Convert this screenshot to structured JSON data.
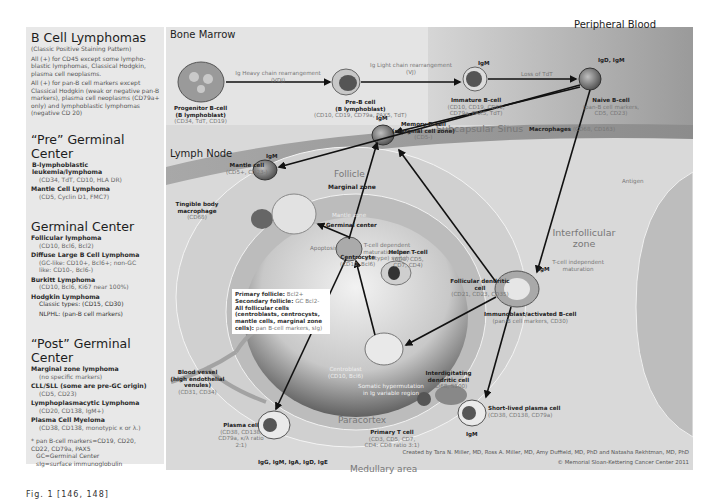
{
  "left_panel": {
    "title": "B Cell Lymphomas",
    "subtitle": "(Classic Positive Staining Pattern)",
    "notes": [
      "All (+) for CD45 except some lympho-blastic lymphomas, Classical Hodgkin, plasma cell neoplasms.",
      "All (+) for pan-B cell markers except Classical Hodgkin (weak or negative pan-B markers), plasma cell neoplasms (CD79a+ only) and lymphoblastic lymphomas (negative CD 20)"
    ],
    "sections": [
      {
        "heading": "“Pre” Germinal Center",
        "items": [
          {
            "name": "B-lymphoblastic leukemia/lymphoma",
            "markers": "(CD34, TdT, CD10, HLA DR)"
          },
          {
            "name": "Mantle Cell Lymphoma",
            "markers": "(CD5, Cyclin D1, FMC7)"
          }
        ]
      },
      {
        "heading": "Germinal Center",
        "items": [
          {
            "name": "Follicular lymphoma",
            "markers": "(CD10, Bcl6, Bcl2)"
          },
          {
            "name": "Diffuse Large B Cell Lymphoma",
            "markers": "(GC-like: CD10+, Bcl6+; non-GC like: CD10-, Bcl6-)"
          },
          {
            "name": "Burkitt Lymphoma",
            "markers": "(CD10, Bcl6, Ki67 near 100%)"
          },
          {
            "name": "Hodgkin Lymphoma",
            "markers": "Classic types: (CD15, CD30)",
            "extra": "NLPHL: (pan-B cell markers)"
          }
        ]
      },
      {
        "heading": "“Post” Germinal Center",
        "items": [
          {
            "name": "Marginal zone lymphoma",
            "markers": "(no specific markers)"
          },
          {
            "name": "CLL/SLL (some are pre-GC origin)",
            "markers": "(CD5, CD23)"
          },
          {
            "name": "Lymphoplasmacytic Lymphoma",
            "markers": "(CD20, CD138, IgM+)"
          },
          {
            "name": "Plasma Cell Myeloma",
            "markers": "(CD38, CD138, monotypic κ or λ.)"
          }
        ]
      }
    ],
    "footnotes": [
      "* pan B-cell markers=CD19, CD20, CD22, CD79a, PAX5",
      "GC=Germinal Center",
      "sIg=surface immunoglobulin"
    ]
  },
  "regions": {
    "bone_marrow": "Bone Marrow",
    "peripheral_blood": "Peripheral Blood",
    "lymph_node": "Lymph Node",
    "subcapsular_sinus": "Subcapsular Sinus",
    "macrophages_bold": "Macrophages",
    "macrophages_markers": "(CD68, CD163)",
    "follicle": "Follicle",
    "marginal_zone": "Marginal zone",
    "mantle_zone": "Mantle zone",
    "germinal_center": "Germinal center",
    "interfollicular_zone": "Interfollicular zone",
    "paracortex": "Paracortex",
    "medullary_area": "Medullary area"
  },
  "arrows": {
    "heavy_chain": "Ig Heavy chain rearrangement (VDJ)",
    "light_chain": "Ig Light chain rearrangement (VJ)",
    "loss_tdt": "Loss of TdT",
    "antigen": "Antigen",
    "t_dep": "T-cell dependent maturation Class (isotype) switch",
    "t_indep": "T-cell independent maturation",
    "apoptosis": "Apoptosis",
    "somatic": "Somatic hypermutation in Ig variable region"
  },
  "cells": {
    "progenitor": {
      "name": "Progenitor B-cell",
      "sub": "(B lymphoblast)",
      "markers": "(CD34, TdT, CD19)"
    },
    "pre_b": {
      "name": "Pre-B cell",
      "sub": "(B lymphoblast)",
      "markers": "(CD10, CD19, CD79a, PAX5, TdT)"
    },
    "immature": {
      "name": "Immature B-cell",
      "markers": "(CD10, CD19, CD20, CD79a, PAX5, TdT)",
      "ig": "IgM"
    },
    "naive": {
      "name": "Naive B-cell",
      "markers": "(pan-B cell markers, CD5, CD23)",
      "ig": "IgD, IgM"
    },
    "mantle": {
      "name": "Mantle cell",
      "markers": "(CD5+, CD23-)",
      "ig": "IgM"
    },
    "memory": {
      "name": "Memory B-cell",
      "sub": "(marginal cell zone)",
      "markers": "(CD5-)",
      "ig": "IgM"
    },
    "tingible": {
      "name": "Tingible body macrophage",
      "markers": "(CD68)"
    },
    "centrocyte": {
      "name": "Centrocyte",
      "markers": "(CD10, Bcl6)"
    },
    "helper_t": {
      "name": "Helper T-cell",
      "markers": "(CD3, CD5, CD7, CD4)"
    },
    "fdc": {
      "name": "Follicular dendritic cell",
      "markers": "(CD21, CD23, CD35)"
    },
    "immunoblast": {
      "name": "Immunoblast/activated B-cell",
      "markers": "(pan-B cell markers, CD30)",
      "ig": "IgM"
    },
    "centroblast": {
      "name": "Centroblast",
      "markers": "(CD10, Bcl6)"
    },
    "blood_vessel": {
      "name": "Blood vessel (high endothelial venules)",
      "markers": "(CD31, CD34)"
    },
    "idc": {
      "name": "Interdigitating dendritic cell",
      "markers": "(CD68, S100)"
    },
    "primary_t": {
      "name": "Primary T cell",
      "markers": "(CD3, CD5, CD7, CD4: CD8 ratio 3:1)"
    },
    "plasma": {
      "name": "Plasma cell",
      "markers": "(CD38, CD138, CD79a, κ/λ ratio 2:1)",
      "ig": "IgG, IgM, IgA, IgD, IgE"
    },
    "short_plasma": {
      "name": "Short-lived plasma cell",
      "markers": "(CD38, CD138, CD79a)",
      "ig": "IgM"
    }
  },
  "follicle_box": {
    "line1_b": "Primary follicle:",
    "line1": " Bcl2+",
    "line2_b": "Secondary follicle:",
    "line2": " GC Bcl2-",
    "line3_b": "All follicular cells (centroblasts, centrocysts, mantle cells, marginal zone cells):",
    "line3": " pan B-cell markers, sIg)"
  },
  "credits": {
    "authors": "Created by Tara N. Miller, MD, Ross A. Miller, MD, Amy Duffield, MD, PhD and Natasha Rekhtman, MD, PhD",
    "copyright": "© Memorial Sloan-Kettering Cancer Center 2011"
  },
  "caption": "Fig. 1 [146, 148]"
}
